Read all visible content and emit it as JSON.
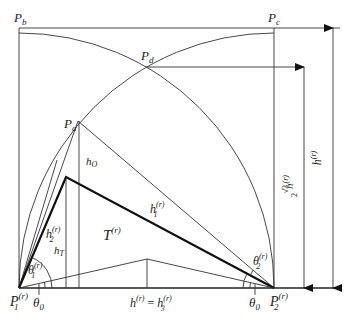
{
  "figure": {
    "type": "geometric-construction",
    "points": {
      "P1": {
        "label": "P",
        "sub": "1",
        "sup": "(r)"
      },
      "P2": {
        "label": "P",
        "sub": "2",
        "sup": "(r)"
      },
      "Pa": {
        "label": "P",
        "sub": "a"
      },
      "Pb": {
        "label": "P",
        "sub": "b"
      },
      "Pc": {
        "label": "P",
        "sub": "c"
      },
      "Pd": {
        "label": "P",
        "sub": "d"
      }
    },
    "labels": {
      "h_O": {
        "main": "h",
        "sub": "O"
      },
      "h_T": {
        "main": "h",
        "sub": "T"
      },
      "h1": {
        "main": "h",
        "sub": "1",
        "sup": "(r)"
      },
      "h2": {
        "main": "h",
        "sub": "2",
        "sup": "(r)"
      },
      "T": {
        "main": "T",
        "sup": "(r)"
      },
      "theta1": {
        "main": "θ",
        "sub": "1",
        "sup": "(r)"
      },
      "theta2": {
        "main": "θ",
        "sub": "2",
        "sup": "(r)"
      },
      "theta0_left": {
        "main": "θ",
        "sub": "0"
      },
      "theta0_right": {
        "main": "θ",
        "sub": "0"
      },
      "base": {
        "left": "h",
        "left_sup": "(r)",
        "eq": " = ",
        "right": "h",
        "right_sub": "3",
        "right_sup": "(r)"
      },
      "dim_inner": {
        "frac_num": "√3",
        "frac_den": "2",
        "main": "h",
        "sup": "(r)"
      },
      "dim_outer": {
        "main": "h",
        "sup": "(r)"
      }
    },
    "colors": {
      "line": "#333333",
      "bold": "#111111",
      "text": "#222222",
      "background": "#ffffff"
    }
  }
}
